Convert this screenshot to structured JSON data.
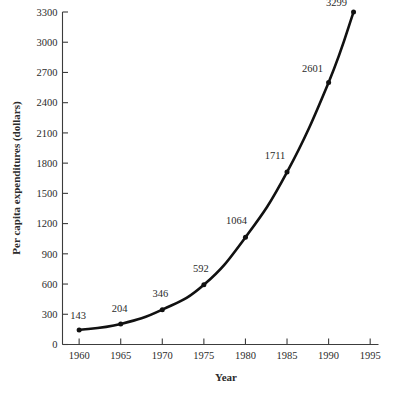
{
  "chart_data": {
    "type": "line",
    "title": "",
    "subtitle": "",
    "xlabel": "Year",
    "ylabel": "Per capita expenditures (dollars)",
    "xlim": [
      1958,
      1996
    ],
    "ylim": [
      0,
      3300
    ],
    "grid": false,
    "legend": "none",
    "x_tick_labels": [
      "1960",
      "1965",
      "1970",
      "1975",
      "1980",
      "1985",
      "1990",
      "1995"
    ],
    "x_ticks": [
      1960,
      1965,
      1970,
      1975,
      1980,
      1985,
      1990,
      1995
    ],
    "y_tick_labels": [
      "0",
      "300",
      "600",
      "900",
      "1200",
      "1500",
      "1800",
      "2100",
      "2400",
      "2700",
      "3000",
      "3300"
    ],
    "y_ticks": [
      0,
      300,
      600,
      900,
      1200,
      1500,
      1800,
      2100,
      2400,
      2700,
      3000,
      3300
    ],
    "x": [
      1960,
      1965,
      1970,
      1975,
      1980,
      1985,
      1990,
      1993
    ],
    "values": [
      143,
      204,
      346,
      592,
      1064,
      1711,
      2601,
      3299
    ],
    "point_labels": [
      "143",
      "204",
      "346",
      "592",
      "1064",
      "1711",
      "2601",
      "3299"
    ],
    "series": [
      {
        "name": "Per capita expenditures",
        "x": [
          1960,
          1965,
          1970,
          1975,
          1980,
          1985,
          1990,
          1993
        ],
        "values": [
          143,
          204,
          346,
          592,
          1064,
          1711,
          2601,
          3299
        ],
        "color": "#111111",
        "marker": "circle"
      }
    ],
    "annotations": [
      {
        "text": "143",
        "x": 1960,
        "y": 143
      },
      {
        "text": "204",
        "x": 1965,
        "y": 204
      },
      {
        "text": "346",
        "x": 1970,
        "y": 346
      },
      {
        "text": "592",
        "x": 1975,
        "y": 592
      },
      {
        "text": "1064",
        "x": 1980,
        "y": 1064
      },
      {
        "text": "1711",
        "x": 1985,
        "y": 1711
      },
      {
        "text": "2601",
        "x": 1990,
        "y": 2601
      },
      {
        "text": "3299",
        "x": 1993,
        "y": 3299
      }
    ]
  },
  "colors": {
    "line": "#111111",
    "axis": "#3c3c3c",
    "text": "#2b2b2b",
    "background": "#ffffff"
  }
}
